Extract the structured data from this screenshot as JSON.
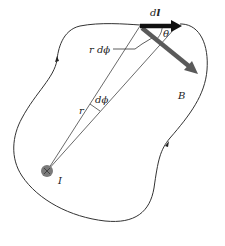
{
  "figure": {
    "type": "physics-diagram",
    "labels": {
      "dl": "dl",
      "dl_d": "d",
      "dl_l": "l",
      "theta": "θ",
      "B": "B",
      "r_dphi": "r dϕ",
      "r": "r",
      "dphi": "dϕ",
      "I": "I"
    },
    "colors": {
      "curve": "#333333",
      "radial_lines": "#444444",
      "dl_vector": "#111111",
      "B_vector": "#5a5a5a",
      "current_source": "#7a7a7a",
      "background": "#ffffff"
    },
    "elements": {
      "current_source": {
        "cx": 47,
        "cy": 171,
        "r": 6
      },
      "dl_vector": {
        "x1": 140,
        "y1": 25,
        "x2": 180,
        "y2": 25
      },
      "B_vector": {
        "x1": 141,
        "y1": 27,
        "x2": 196,
        "y2": 72
      },
      "loop_direction_arrows": [
        {
          "x": 57,
          "y": 59
        },
        {
          "x": 168,
          "y": 144
        }
      ]
    }
  }
}
